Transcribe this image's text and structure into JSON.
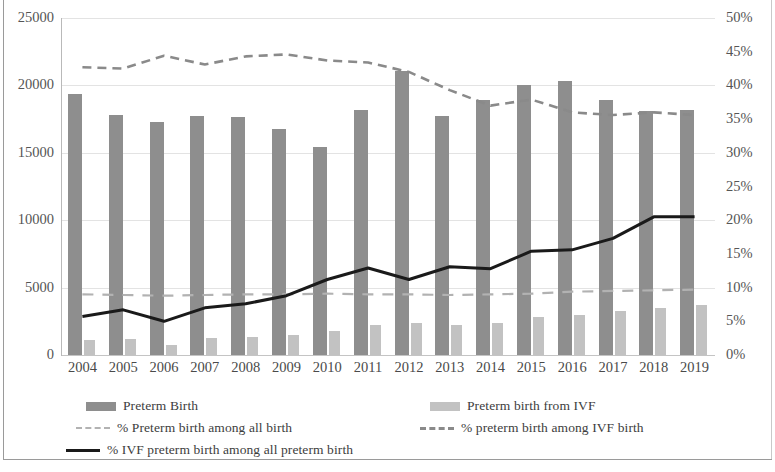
{
  "chart_data": {
    "type": "bar",
    "title": "",
    "subtitle": "",
    "xlabel": "",
    "ylabel": "",
    "categories": [
      "2004",
      "2005",
      "2006",
      "2007",
      "2008",
      "2009",
      "2010",
      "2011",
      "2012",
      "2013",
      "2014",
      "2015",
      "2016",
      "2017",
      "2018",
      "2019"
    ],
    "left_axis": {
      "label": "",
      "ylim": [
        0,
        25000
      ],
      "ticks": [
        "0",
        "5000",
        "10000",
        "15000",
        "20000",
        "25000"
      ],
      "tick_values": [
        0,
        5000,
        10000,
        15000,
        20000,
        25000
      ]
    },
    "right_axis": {
      "label": "",
      "ylim": [
        0,
        50
      ],
      "ticks": [
        "0%",
        "5%",
        "10%",
        "15%",
        "20%",
        "25%",
        "30%",
        "35%",
        "40%",
        "45%",
        "50%"
      ],
      "tick_values": [
        0,
        5,
        10,
        15,
        20,
        25,
        30,
        35,
        40,
        45,
        50
      ]
    },
    "grid": true,
    "legend_position": "bottom",
    "series": [
      {
        "name": "Preterm Birth",
        "type": "bar",
        "axis": "left",
        "color": "#8e8e8e",
        "values": [
          19400,
          17800,
          17250,
          17700,
          17650,
          16800,
          15450,
          18150,
          21100,
          17700,
          18950,
          20050,
          20350,
          18900,
          18100,
          18150
        ]
      },
      {
        "name": "Preterm birth from IVF",
        "type": "bar",
        "axis": "left",
        "color": "#c2c2c2",
        "values": [
          1150,
          1200,
          750,
          1250,
          1350,
          1500,
          1750,
          2200,
          2350,
          2200,
          2350,
          2850,
          3000,
          3250,
          3500,
          3700
        ]
      },
      {
        "name": "% Preterm birth among all birth",
        "type": "line",
        "style": "dashed",
        "axis": "right",
        "color": "#b2b2b2",
        "values": [
          9.0,
          8.9,
          8.8,
          8.9,
          9.0,
          9.0,
          9.1,
          9.0,
          9.0,
          8.9,
          9.0,
          9.1,
          9.4,
          9.5,
          9.6,
          9.7
        ]
      },
      {
        "name": "% preterm birth among IVF birth",
        "type": "line",
        "style": "dashed",
        "axis": "right",
        "color": "#8a8a8a",
        "values": [
          42.7,
          42.5,
          44.4,
          43.1,
          44.3,
          44.6,
          43.7,
          43.4,
          42.0,
          39.3,
          37.0,
          37.9,
          36.0,
          35.6,
          36.0,
          35.6
        ]
      },
      {
        "name": "% IVF preterm birth among all preterm birth",
        "type": "line",
        "style": "solid",
        "axis": "right",
        "color": "#1a1a1a",
        "values": [
          5.7,
          6.7,
          5.0,
          7.0,
          7.6,
          8.8,
          11.2,
          12.9,
          11.2,
          13.1,
          12.8,
          15.4,
          15.6,
          17.3,
          20.5,
          20.5
        ]
      }
    ]
  },
  "legend": {
    "items": [
      {
        "label": "Preterm Birth",
        "marker": "bar-dark"
      },
      {
        "label": "Preterm birth from IVF",
        "marker": "bar-light"
      },
      {
        "label": "% Preterm birth among all birth",
        "marker": "line-light-dashed"
      },
      {
        "label": "% preterm birth among IVF birth",
        "marker": "line-gray-dashed"
      },
      {
        "label": "% IVF preterm birth among all preterm birth",
        "marker": "line-black-solid"
      }
    ]
  },
  "colors": {
    "bar_primary": "#8e8e8e",
    "bar_ivf": "#c2c2c2",
    "line_all_birth": "#b2b2b2",
    "line_ivf_birth": "#8a8a8a",
    "line_ivf_preterm": "#1a1a1a",
    "gridline": "#e3e3e3",
    "text": "#4a4a4a"
  }
}
